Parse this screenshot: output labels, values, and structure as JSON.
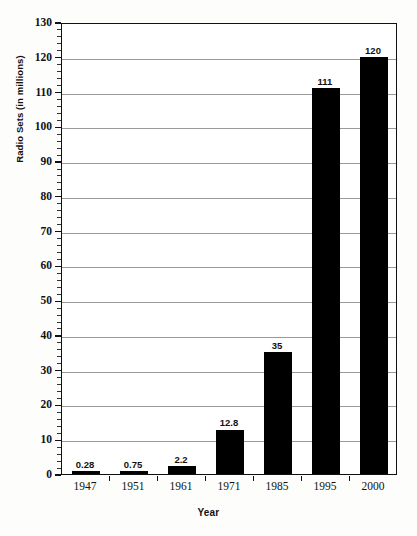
{
  "chart_data": {
    "type": "bar",
    "title": "",
    "xlabel": "Year",
    "ylabel": "Radio Sets (in millions)",
    "categories": [
      "1947",
      "1951",
      "1961",
      "1971",
      "1985",
      "1995",
      "2000"
    ],
    "values": [
      0.28,
      0.75,
      2.2,
      12.8,
      35,
      111,
      120
    ],
    "value_labels": [
      "0.28",
      "0.75",
      "2.2",
      "12.8",
      "35",
      "111",
      "120"
    ],
    "ylim": [
      0,
      130
    ],
    "y_ticks": [
      0,
      10,
      20,
      30,
      40,
      50,
      60,
      70,
      80,
      90,
      100,
      110,
      120,
      130
    ],
    "y_tick_labels": [
      "0",
      "10",
      "20",
      "30",
      "40",
      "50",
      "60",
      "70",
      "80",
      "90",
      "100",
      "110",
      "120",
      "130"
    ],
    "y_minor_tick_interval": 2,
    "grid": true,
    "grid_axis": "y",
    "legend": false,
    "bar_color": "#000000",
    "grid_color": "#9a9a9a",
    "axis_color": "#111111",
    "background_color": "#ffffff"
  }
}
